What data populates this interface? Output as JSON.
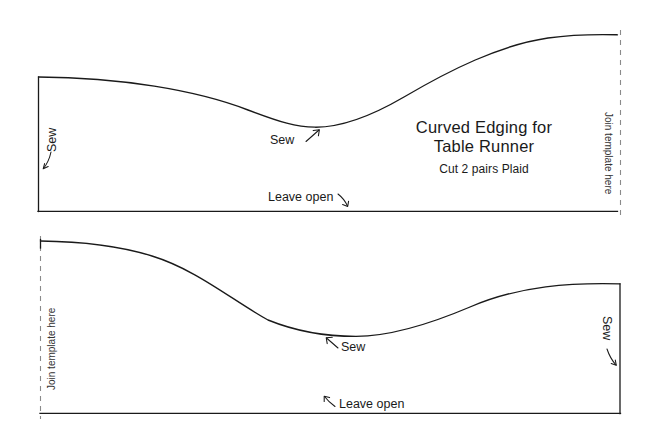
{
  "document": {
    "kind": "sewing-pattern-template",
    "background_color": "#ffffff",
    "ink_color": "#1a1a1a"
  },
  "title_block": {
    "line1": "Curved Edging for",
    "line2": "Table Runner",
    "subtitle": "Cut 2 pairs Plaid"
  },
  "top_panel": {
    "edge_sew_label": "Sew",
    "curve_sew_label": "Sew",
    "bottom_label": "Leave open",
    "join_label": "Join template here"
  },
  "bottom_panel": {
    "join_label": "Join template here",
    "curve_sew_label": "Sew",
    "bottom_label": "Leave open",
    "edge_sew_label": "Sew"
  }
}
